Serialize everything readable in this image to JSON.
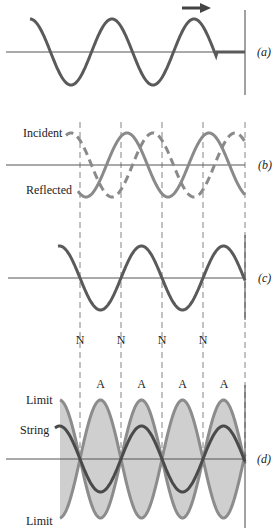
{
  "colors": {
    "string": "#5a5a5a",
    "reflected": "#8a8a8a",
    "incident_dashed": "#8a8a8a",
    "limit_line": "#8c8c8c",
    "envelope_fill": "#cfcfcf",
    "axis": "#555555",
    "guide": "#666666"
  },
  "panels": {
    "a": {
      "label": "(a)"
    },
    "b": {
      "label": "(b)",
      "incident_label": "Incident",
      "reflected_label": "Reflected"
    },
    "c": {
      "label": "(c)"
    },
    "d": {
      "label": "(d)",
      "limit_top_label": "Limit",
      "string_label": "String",
      "limit_bottom_label": "Limit"
    }
  },
  "node_labels": [
    "N",
    "N",
    "N",
    "N"
  ],
  "antinode_labels": [
    "A",
    "A",
    "A",
    "A"
  ]
}
